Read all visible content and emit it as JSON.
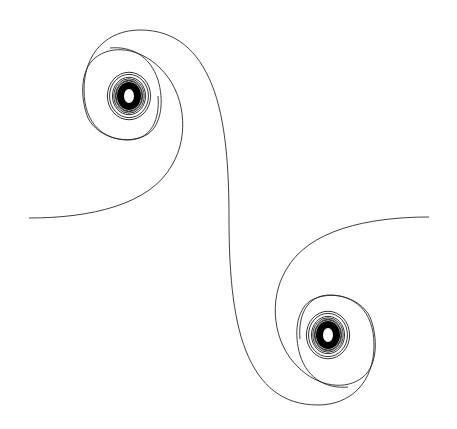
{
  "figure": {
    "title": "Euler (Cornu) double spiral",
    "background": "#ffffff",
    "stroke_color": "#2a2a2a",
    "core_color": "#000000"
  },
  "geometry": {
    "center": [
      229,
      218
    ],
    "left_tail_end": [
      29,
      218
    ],
    "right_tail_end": [
      429,
      217
    ],
    "upper_spiral_center": [
      129,
      96
    ],
    "lower_spiral_center": [
      328,
      335
    ]
  }
}
